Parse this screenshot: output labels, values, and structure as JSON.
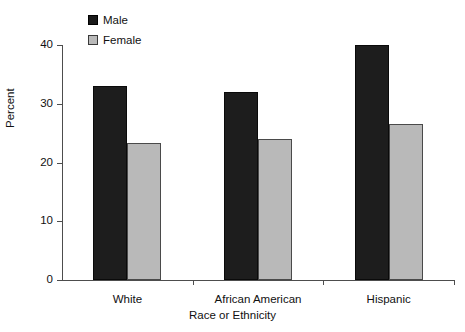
{
  "chart_data": {
    "type": "bar",
    "title": "",
    "xlabel": "Race or Ethnicity",
    "ylabel": "Percent",
    "categories": [
      "White",
      "African American",
      "Hispanic"
    ],
    "series": [
      {
        "name": "Male",
        "color": "#1d1d1d",
        "values": [
          33,
          32,
          40
        ]
      },
      {
        "name": "Female",
        "color": "#b9b9b9",
        "values": [
          23.3,
          24,
          26.5
        ]
      }
    ],
    "ylim": [
      0,
      40
    ],
    "yticks": [
      0,
      10,
      20,
      30,
      40
    ],
    "ytick_labels": [
      "0",
      "10",
      "20",
      "30",
      "40"
    ],
    "grid": false,
    "legend_position": "top-left-inside"
  },
  "legend": {
    "items": [
      {
        "label": "Male",
        "swatch": "legend-swatch-male"
      },
      {
        "label": "Female",
        "swatch": "legend-swatch-female"
      }
    ]
  }
}
